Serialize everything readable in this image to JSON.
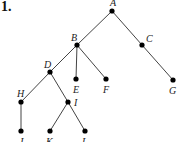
{
  "problem_number": "1.",
  "tree": {
    "nodes": [
      {
        "id": "A",
        "label": "A",
        "x": 112,
        "y": 11,
        "lx": 110,
        "ly": 6
      },
      {
        "id": "B",
        "label": "B",
        "x": 77,
        "y": 45,
        "lx": 71,
        "ly": 41
      },
      {
        "id": "C",
        "label": "C",
        "x": 142,
        "y": 45,
        "lx": 146,
        "ly": 42
      },
      {
        "id": "D",
        "label": "D",
        "x": 50,
        "y": 72,
        "lx": 44,
        "ly": 68
      },
      {
        "id": "E",
        "label": "E",
        "x": 76,
        "y": 79,
        "lx": 73,
        "ly": 93
      },
      {
        "id": "F",
        "label": "F",
        "x": 106,
        "y": 79,
        "lx": 103,
        "ly": 93
      },
      {
        "id": "G",
        "label": "G",
        "x": 173,
        "y": 80,
        "lx": 169,
        "ly": 94
      },
      {
        "id": "H",
        "label": "H",
        "x": 21,
        "y": 102,
        "lx": 17,
        "ly": 97
      },
      {
        "id": "I",
        "label": "I",
        "x": 68,
        "y": 102,
        "lx": 74,
        "ly": 106
      },
      {
        "id": "J",
        "label": "J",
        "x": 21,
        "y": 131,
        "lx": 19,
        "ly": 145
      },
      {
        "id": "K",
        "label": "K",
        "x": 50,
        "y": 131,
        "lx": 46,
        "ly": 145
      },
      {
        "id": "L",
        "label": "L",
        "x": 85,
        "y": 131,
        "lx": 82,
        "ly": 145
      }
    ],
    "edges": [
      [
        "A",
        "B"
      ],
      [
        "A",
        "C"
      ],
      [
        "B",
        "D"
      ],
      [
        "B",
        "E"
      ],
      [
        "B",
        "F"
      ],
      [
        "C",
        "G"
      ],
      [
        "D",
        "H"
      ],
      [
        "D",
        "I"
      ],
      [
        "H",
        "J"
      ],
      [
        "I",
        "K"
      ],
      [
        "I",
        "L"
      ]
    ]
  }
}
